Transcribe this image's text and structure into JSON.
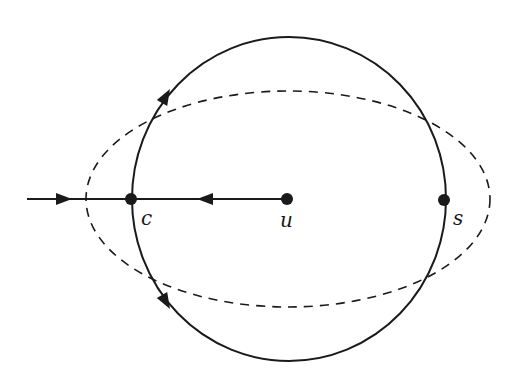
{
  "diagram": {
    "type": "orbit-diagram",
    "colors": {
      "stroke": "#1a1a1a",
      "background": "#ffffff"
    },
    "circle": {
      "cx": 289,
      "cy": 199,
      "rx": 157,
      "ry": 162,
      "style": "solid"
    },
    "ellipse": {
      "cx": 288,
      "cy": 199,
      "rx": 202,
      "ry": 108,
      "style": "dashed"
    },
    "nodes": [
      {
        "id": "c",
        "label": "c",
        "x": 131,
        "y": 199,
        "label_x": 141,
        "label_y": 225
      },
      {
        "id": "u",
        "label": "u",
        "x": 287,
        "y": 199,
        "label_x": 280,
        "label_y": 227
      },
      {
        "id": "s",
        "label": "s",
        "x": 444,
        "y": 200,
        "label_x": 453,
        "label_y": 225
      }
    ],
    "edges": [
      {
        "from": "external",
        "to": "c",
        "direction": "right"
      },
      {
        "from": "u",
        "to": "c",
        "direction": "left"
      }
    ],
    "arrows_on_circle": [
      {
        "position": "upper-left",
        "direction": "up-right"
      },
      {
        "position": "lower-left",
        "direction": "down-right"
      }
    ]
  }
}
